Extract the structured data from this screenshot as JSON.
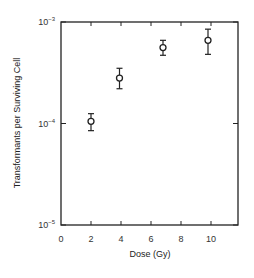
{
  "chart_data": {
    "type": "scatter",
    "title": "",
    "xlabel": "Dose (Gy)",
    "ylabel": "Transformants per Surviving Cell",
    "xlim": [
      0,
      11.8
    ],
    "ylim": [
      1e-05,
      0.001
    ],
    "yscale": "log",
    "grid": false,
    "legend": null,
    "x_ticks": [
      0,
      2,
      4,
      6,
      8,
      10
    ],
    "x_tick_labels": [
      "0",
      "2",
      "4",
      "6",
      "8",
      "10"
    ],
    "y_ticks": [
      1e-05,
      0.0001,
      0.001
    ],
    "y_tick_labels": [
      {
        "base": "10",
        "exp": "-5"
      },
      {
        "base": "10",
        "exp": "-4"
      },
      {
        "base": "10",
        "exp": "-3"
      }
    ],
    "series": [
      {
        "name": "Transformants",
        "marker": "open-circle",
        "points": [
          {
            "x": 2.0,
            "y": 0.000105,
            "err_low": 8.5e-05,
            "err_high": 0.000125
          },
          {
            "x": 3.9,
            "y": 0.00028,
            "err_low": 0.00022,
            "err_high": 0.00035
          },
          {
            "x": 6.8,
            "y": 0.00056,
            "err_low": 0.00047,
            "err_high": 0.00066
          },
          {
            "x": 9.8,
            "y": 0.00066,
            "err_low": 0.00048,
            "err_high": 0.00085
          }
        ]
      }
    ]
  },
  "colors": {
    "axis": "#222222",
    "marker": "#222222",
    "background": "#ffffff"
  }
}
